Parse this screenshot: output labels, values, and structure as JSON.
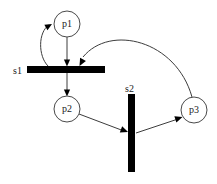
{
  "diagram": {
    "background_color": "#ffffff",
    "stroke_color": "#3c3c3c",
    "fill_color": "#000000",
    "width": 217,
    "height": 184,
    "places": [
      {
        "id": "p1",
        "label": "p1",
        "cx": 67,
        "cy": 24,
        "r": 13
      },
      {
        "id": "p2",
        "label": "p2",
        "cx": 67,
        "cy": 109,
        "r": 13
      },
      {
        "id": "p3",
        "label": "p3",
        "cx": 194,
        "cy": 110,
        "r": 13
      }
    ],
    "transitions": [
      {
        "id": "s1",
        "label": "s1",
        "orientation": "horizontal",
        "x": 27,
        "y": 66,
        "width": 78,
        "height": 7,
        "label_x": 13,
        "label_y": 74
      },
      {
        "id": "s2",
        "label": "s2",
        "orientation": "vertical",
        "x": 128,
        "y": 94,
        "width": 7,
        "height": 78,
        "label_x": 125,
        "label_y": 92
      }
    ],
    "arcs": [
      {
        "id": "arc-s1-to-p1",
        "from": "s1",
        "to": "p1",
        "path": "M 48 66 C 38 56 38 32 49 25",
        "head_x": 52,
        "head_y": 24,
        "head_angle": -30
      },
      {
        "id": "arc-p1-to-s1",
        "from": "p1",
        "to": "s1",
        "path": "M 67 37 L 67 64",
        "head_x": 67,
        "head_y": 66,
        "head_angle": 90
      },
      {
        "id": "arc-s1-to-p2",
        "from": "s1",
        "to": "p2",
        "path": "M 67 73 L 67 94",
        "head_x": 67,
        "head_y": 96,
        "head_angle": 90
      },
      {
        "id": "arc-p3-to-s1",
        "from": "p3",
        "to": "s1",
        "path": "M 192 97 C 176 40 110 24 83 57",
        "head_x": 79,
        "head_y": 65,
        "head_angle": 115
      },
      {
        "id": "arc-p2-to-s2",
        "from": "p2",
        "to": "s2",
        "path": "M 79 114 L 124 131",
        "head_x": 127,
        "head_y": 132,
        "head_angle": 21
      },
      {
        "id": "arc-s2-to-p3",
        "from": "s2",
        "to": "p3",
        "path": "M 136 133 L 178 119",
        "head_x": 182,
        "head_y": 117,
        "head_angle": -18
      }
    ]
  }
}
